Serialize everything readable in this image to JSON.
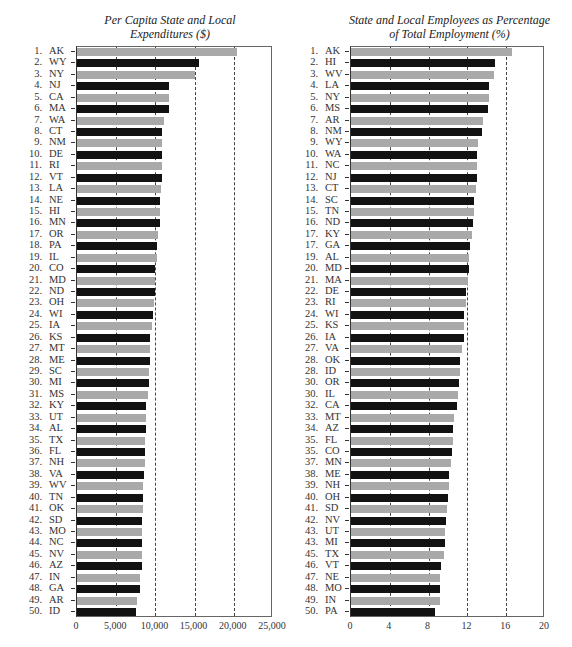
{
  "chart_data": [
    {
      "type": "bar",
      "orientation": "horizontal",
      "title": "Per Capita State and Local Expenditures ($)",
      "xlabel": "",
      "ylabel": "",
      "xlim": [
        0,
        25000
      ],
      "xticks": [
        "0",
        "5,000",
        "10,000",
        "15,000",
        "20,000",
        "25,000"
      ],
      "grid": "vertical dashed at 5,000 intervals",
      "ranks": [
        "1.",
        "2.",
        "3.",
        "4.",
        "5.",
        "6.",
        "7.",
        "8.",
        "9.",
        "10.",
        "11.",
        "12.",
        "13.",
        "14.",
        "15.",
        "16.",
        "17.",
        "18.",
        "19.",
        "20.",
        "21.",
        "22.",
        "23.",
        "24.",
        "25.",
        "26.",
        "27.",
        "28.",
        "29.",
        "30.",
        "31.",
        "32.",
        "33.",
        "34.",
        "35.",
        "36.",
        "37.",
        "38.",
        "39.",
        "40.",
        "41.",
        "42.",
        "43.",
        "44.",
        "45.",
        "46.",
        "47.",
        "48.",
        "49.",
        "50."
      ],
      "categories": [
        "AK",
        "WY",
        "NY",
        "NJ",
        "CA",
        "MA",
        "WA",
        "CT",
        "NM",
        "DE",
        "RI",
        "VT",
        "LA",
        "NE",
        "HI",
        "MN",
        "OR",
        "PA",
        "IL",
        "CO",
        "MD",
        "ND",
        "OH",
        "WI",
        "IA",
        "KS",
        "MT",
        "ME",
        "SC",
        "MI",
        "MS",
        "KY",
        "UT",
        "AL",
        "TX",
        "FL",
        "NH",
        "VA",
        "WV",
        "TN",
        "OK",
        "SD",
        "MO",
        "NC",
        "NV",
        "AZ",
        "IN",
        "GA",
        "AR",
        "ID"
      ],
      "values": [
        20400,
        15500,
        15100,
        11700,
        11700,
        11700,
        11150,
        10900,
        10850,
        10800,
        10800,
        10800,
        10750,
        10650,
        10550,
        10550,
        10300,
        10250,
        10150,
        10000,
        9950,
        9900,
        9850,
        9700,
        9600,
        9300,
        9300,
        9250,
        9200,
        9150,
        9100,
        8850,
        8800,
        8750,
        8700,
        8650,
        8650,
        8550,
        8450,
        8400,
        8400,
        8350,
        8350,
        8350,
        8300,
        8250,
        8050,
        8050,
        7700,
        7500
      ]
    },
    {
      "type": "bar",
      "orientation": "horizontal",
      "title": "State and Local Employees as Percentage of Total Employment (%)",
      "xlabel": "",
      "ylabel": "",
      "xlim": [
        0,
        20
      ],
      "xticks": [
        "0",
        "4",
        "8",
        "12",
        "16",
        "20"
      ],
      "grid": "vertical dashed at 4 intervals",
      "ranks": [
        "1.",
        "2.",
        "3.",
        "4.",
        "5.",
        "6.",
        "7.",
        "8.",
        "9.",
        "10.",
        "11.",
        "12.",
        "13.",
        "14.",
        "15.",
        "16.",
        "17.",
        "17.",
        "19.",
        "20.",
        "21.",
        "22.",
        "23.",
        "24.",
        "25.",
        "26.",
        "27.",
        "28.",
        "28.",
        "30.",
        "30.",
        "32.",
        "33.",
        "34.",
        "35.",
        "35.",
        "37.",
        "38.",
        "39.",
        "40.",
        "41.",
        "42.",
        "43.",
        "43.",
        "45.",
        "46.",
        "47.",
        "48.",
        "49.",
        "50."
      ],
      "categories": [
        "AK",
        "HI",
        "WV",
        "LA",
        "NY",
        "MS",
        "AR",
        "NM",
        "WY",
        "WA",
        "NC",
        "NJ",
        "CT",
        "SC",
        "TN",
        "ND",
        "KY",
        "GA",
        "AL",
        "MD",
        "MA",
        "DE",
        "RI",
        "WI",
        "KS",
        "IA",
        "VA",
        "OK",
        "ID",
        "OR",
        "IL",
        "CA",
        "MT",
        "AZ",
        "FL",
        "CO",
        "MN",
        "ME",
        "NH",
        "OH",
        "SD",
        "NV",
        "UT",
        "MI",
        "TX",
        "VT",
        "NE",
        "MO",
        "IN",
        "PA"
      ],
      "values": [
        16.6,
        14.8,
        14.7,
        14.2,
        14.2,
        14.1,
        13.6,
        13.5,
        13.1,
        13.0,
        13.0,
        13.0,
        12.9,
        12.7,
        12.7,
        12.6,
        12.5,
        12.3,
        12.2,
        12.2,
        12.1,
        11.9,
        11.9,
        11.7,
        11.6,
        11.6,
        11.4,
        11.2,
        11.2,
        11.1,
        11.0,
        10.9,
        10.6,
        10.5,
        10.5,
        10.4,
        10.3,
        10.1,
        10.1,
        10.0,
        9.9,
        9.8,
        9.7,
        9.7,
        9.6,
        9.3,
        9.2,
        9.2,
        9.2,
        8.7
      ]
    }
  ],
  "colors": {
    "light_bar": "#a9a9a9",
    "dark_bar": "#121212",
    "grid": "#444444"
  }
}
